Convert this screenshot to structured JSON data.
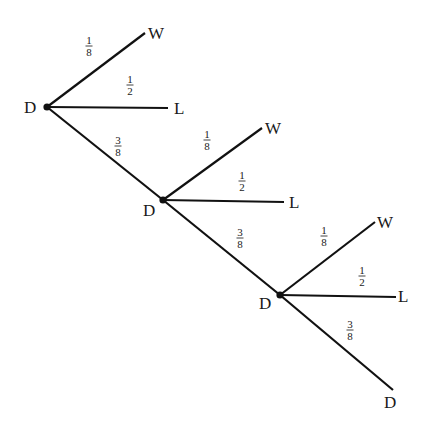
{
  "diagram": {
    "type": "probability-tree",
    "nodes": [
      {
        "id": "n1",
        "label": "D",
        "x": 47,
        "y": 107,
        "lx": 24,
        "ly": 113
      },
      {
        "id": "n2",
        "label": "D",
        "x": 163,
        "y": 200,
        "lx": 143,
        "ly": 216
      },
      {
        "id": "n3",
        "label": "D",
        "x": 280,
        "y": 295,
        "lx": 259,
        "ly": 309
      }
    ],
    "edges": [
      {
        "from": "n1",
        "to_label": "W",
        "x2": 145,
        "y2": 33,
        "num": "1",
        "den": "8",
        "fx": 89,
        "fy": 46,
        "tx": 148,
        "ty": 39
      },
      {
        "from": "n1",
        "to_label": "L",
        "x2": 168,
        "y2": 108,
        "num": "1",
        "den": "2",
        "fx": 130,
        "fy": 85,
        "tx": 174,
        "ty": 114
      },
      {
        "from": "n1",
        "to_label": "",
        "x2": 163,
        "y2": 200,
        "num": "3",
        "den": "8",
        "fx": 118,
        "fy": 146,
        "tx": 0,
        "ty": 0
      },
      {
        "from": "n2",
        "to_label": "W",
        "x2": 262,
        "y2": 128,
        "num": "1",
        "den": "8",
        "fx": 207,
        "fy": 140,
        "tx": 265,
        "ty": 134
      },
      {
        "from": "n2",
        "to_label": "L",
        "x2": 284,
        "y2": 202,
        "num": "1",
        "den": "2",
        "fx": 242,
        "fy": 181,
        "tx": 289,
        "ty": 208
      },
      {
        "from": "n2",
        "to_label": "",
        "x2": 280,
        "y2": 295,
        "num": "3",
        "den": "8",
        "fx": 240,
        "fy": 238,
        "tx": 0,
        "ty": 0
      },
      {
        "from": "n3",
        "to_label": "W",
        "x2": 375,
        "y2": 222,
        "num": "1",
        "den": "8",
        "fx": 324,
        "fy": 236,
        "tx": 377,
        "ty": 228
      },
      {
        "from": "n3",
        "to_label": "L",
        "x2": 396,
        "y2": 297,
        "num": "1",
        "den": "2",
        "fx": 362,
        "fy": 276,
        "tx": 398,
        "ty": 302
      },
      {
        "from": "n3",
        "to_label": "D",
        "x2": 393,
        "y2": 390,
        "num": "3",
        "den": "8",
        "fx": 350,
        "fy": 330,
        "tx": 384,
        "ty": 408
      }
    ]
  }
}
